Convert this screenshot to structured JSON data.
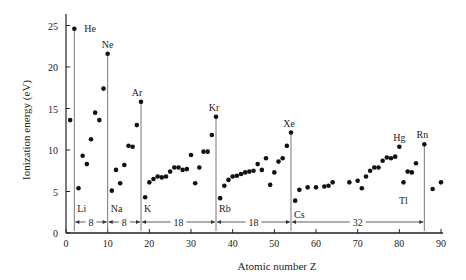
{
  "chart_data": {
    "type": "scatter",
    "title": "",
    "xlabel": "Atomic number Z",
    "ylabel": "Ionization energy (eV)",
    "xlim": [
      0,
      90
    ],
    "ylim": [
      0,
      26
    ],
    "xticks": [
      0,
      10,
      20,
      30,
      40,
      50,
      60,
      70,
      80,
      90
    ],
    "yticks": [
      0,
      5,
      10,
      15,
      20,
      25
    ],
    "grid": false,
    "legend": null,
    "points": [
      [
        1,
        13.6
      ],
      [
        2,
        24.6
      ],
      [
        3,
        5.4
      ],
      [
        4,
        9.3
      ],
      [
        5,
        8.3
      ],
      [
        6,
        11.3
      ],
      [
        7,
        14.5
      ],
      [
        8,
        13.6
      ],
      [
        9,
        17.4
      ],
      [
        10,
        21.6
      ],
      [
        11,
        5.1
      ],
      [
        12,
        7.6
      ],
      [
        13,
        6.0
      ],
      [
        14,
        8.2
      ],
      [
        15,
        10.5
      ],
      [
        16,
        10.4
      ],
      [
        17,
        13.0
      ],
      [
        18,
        15.8
      ],
      [
        19,
        4.3
      ],
      [
        20,
        6.1
      ],
      [
        21,
        6.5
      ],
      [
        22,
        6.8
      ],
      [
        23,
        6.7
      ],
      [
        24,
        6.8
      ],
      [
        25,
        7.4
      ],
      [
        26,
        7.9
      ],
      [
        27,
        7.9
      ],
      [
        28,
        7.6
      ],
      [
        29,
        7.7
      ],
      [
        30,
        9.4
      ],
      [
        31,
        6.0
      ],
      [
        32,
        7.9
      ],
      [
        33,
        9.8
      ],
      [
        34,
        9.8
      ],
      [
        35,
        11.8
      ],
      [
        36,
        14.0
      ],
      [
        37,
        4.2
      ],
      [
        38,
        5.7
      ],
      [
        39,
        6.4
      ],
      [
        40,
        6.8
      ],
      [
        41,
        6.9
      ],
      [
        42,
        7.1
      ],
      [
        43,
        7.3
      ],
      [
        44,
        7.4
      ],
      [
        45,
        7.5
      ],
      [
        46,
        8.3
      ],
      [
        47,
        7.6
      ],
      [
        48,
        9.0
      ],
      [
        49,
        5.8
      ],
      [
        50,
        7.3
      ],
      [
        51,
        8.6
      ],
      [
        52,
        9.0
      ],
      [
        53,
        10.5
      ],
      [
        54,
        12.1
      ],
      [
        55,
        3.9
      ],
      [
        56,
        5.2
      ],
      [
        58,
        5.5
      ],
      [
        60,
        5.5
      ],
      [
        62,
        5.6
      ],
      [
        63,
        5.7
      ],
      [
        64,
        6.1
      ],
      [
        68,
        6.1
      ],
      [
        70,
        6.3
      ],
      [
        71,
        5.4
      ],
      [
        72,
        6.8
      ],
      [
        73,
        7.5
      ],
      [
        74,
        7.9
      ],
      [
        75,
        7.9
      ],
      [
        76,
        8.7
      ],
      [
        77,
        9.1
      ],
      [
        78,
        9.0
      ],
      [
        79,
        9.2
      ],
      [
        80,
        10.4
      ],
      [
        81,
        6.1
      ],
      [
        82,
        7.4
      ],
      [
        83,
        7.3
      ],
      [
        84,
        8.4
      ],
      [
        86,
        10.7
      ],
      [
        88,
        5.3
      ],
      [
        90,
        6.1
      ]
    ],
    "annotations": {
      "noble_gases": [
        {
          "label": "He",
          "z": 2
        },
        {
          "label": "Ne",
          "z": 10
        },
        {
          "label": "Ar",
          "z": 18
        },
        {
          "label": "Kr",
          "z": 36
        },
        {
          "label": "Xe",
          "z": 54
        },
        {
          "label": "Rn",
          "z": 86
        }
      ],
      "alkali": [
        {
          "label": "Li",
          "z": 3
        },
        {
          "label": "Na",
          "z": 11
        },
        {
          "label": "K",
          "z": 19
        },
        {
          "label": "Rb",
          "z": 37
        },
        {
          "label": "Cs",
          "z": 55
        }
      ],
      "others": [
        {
          "label": "Hg",
          "z": 80
        },
        {
          "label": "Tl",
          "z": 81
        }
      ],
      "period_lengths": [
        {
          "label": "8",
          "from": 2,
          "to": 10
        },
        {
          "label": "8",
          "from": 10,
          "to": 18
        },
        {
          "label": "18",
          "from": 18,
          "to": 36
        },
        {
          "label": "18",
          "from": 36,
          "to": 54
        },
        {
          "label": "32",
          "from": 54,
          "to": 86
        }
      ]
    }
  }
}
